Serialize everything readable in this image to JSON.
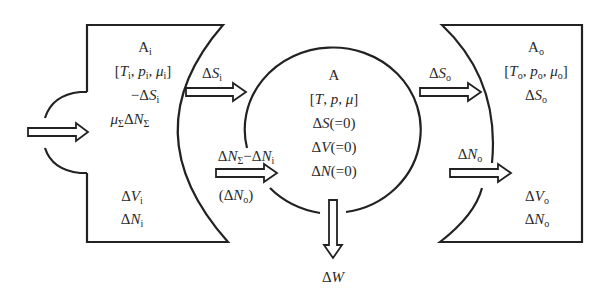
{
  "diagram": {
    "type": "thermodynamic-exchange-schematic",
    "left_reservoir": {
      "name": "A_i",
      "lines": [
        "A_i",
        "[T_i, p_i, μ_i]",
        "−ΔS_i",
        "μ_Σ ΔN_Σ",
        "ΔV_i",
        "ΔN_i"
      ],
      "title": "A",
      "title_sub": "i",
      "params": "[T_i, p_i, μ_i]",
      "entropy": "−ΔS_i",
      "inflow": "μ_Σ ΔN_Σ",
      "volume": "ΔV_i",
      "particles": "ΔN_i"
    },
    "system": {
      "name": "A",
      "title": "A",
      "params": "[T, p, μ]",
      "dS": "ΔS(=0)",
      "dV": "ΔV(=0)",
      "dN": "ΔN(=0)"
    },
    "right_reservoir": {
      "name": "A_o",
      "title": "A",
      "title_sub": "o",
      "params": "[T_o, p_o, μ_o]",
      "entropy": "ΔS_o",
      "volume": "ΔV_o",
      "particles": "ΔN_o"
    },
    "arrows": [
      {
        "id": "inflow-left",
        "label": ""
      },
      {
        "id": "entropy-i-to-system",
        "label": "ΔS_i"
      },
      {
        "id": "particles-to-system",
        "label": "ΔN_Σ − ΔN_i",
        "sublabel": "(ΔN_o)"
      },
      {
        "id": "entropy-system-to-o",
        "label": "ΔS_o"
      },
      {
        "id": "particles-system-to-o",
        "label": "ΔN_o"
      },
      {
        "id": "work-out",
        "label": "ΔW"
      }
    ],
    "colors": {
      "stroke": "#222222",
      "background": "#ffffff"
    }
  }
}
